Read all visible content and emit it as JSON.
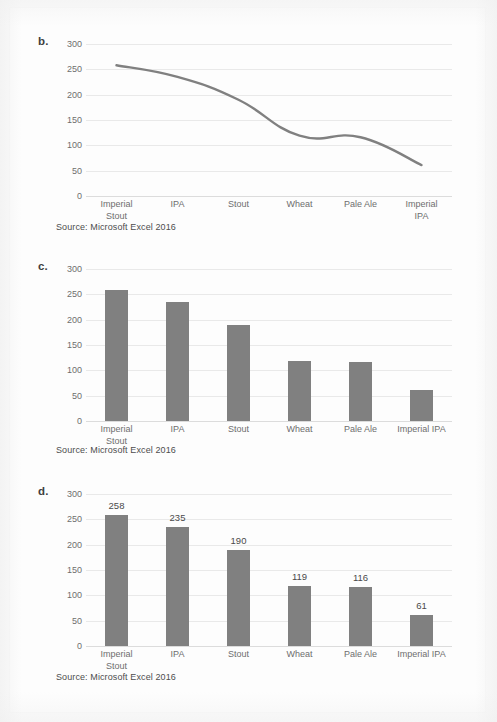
{
  "document": {
    "background_color": "#fdfdfd",
    "series_color": "#808080",
    "gridline_color": "#e9e9e9",
    "text_color": "#6e6e6e"
  },
  "figures": [
    {
      "panel_label": "b.",
      "source_caption": "Source: Microsoft Excel 2016",
      "chart_data": {
        "type": "line",
        "title": "",
        "xlabel": "",
        "ylabel": "",
        "categories": [
          "Imperial Stout",
          "IPA",
          "Stout",
          "Wheat",
          "Pale Ale",
          "Imperial IPA"
        ],
        "category_lines": [
          [
            "Imperial",
            "Stout"
          ],
          [
            "IPA"
          ],
          [
            "Stout"
          ],
          [
            "Wheat"
          ],
          [
            "Pale Ale"
          ],
          [
            "Imperial",
            "IPA"
          ]
        ],
        "values": [
          258,
          235,
          190,
          119,
          116,
          61
        ],
        "ylim": [
          0,
          300
        ],
        "yticks": [
          300,
          250,
          200,
          150,
          100,
          50,
          0
        ],
        "grid": true,
        "legend": "none",
        "smooth": true,
        "show_data_labels": false,
        "show_markers": false
      }
    },
    {
      "panel_label": "c.",
      "source_caption": "Source: Microsoft Excel 2016",
      "chart_data": {
        "type": "bar",
        "title": "",
        "xlabel": "",
        "ylabel": "",
        "categories": [
          "Imperial Stout",
          "IPA",
          "Stout",
          "Wheat",
          "Pale Ale",
          "Imperial IPA"
        ],
        "category_lines": [
          [
            "Imperial",
            "Stout"
          ],
          [
            "IPA"
          ],
          [
            "Stout"
          ],
          [
            "Wheat"
          ],
          [
            "Pale Ale"
          ],
          [
            "Imperial IPA"
          ]
        ],
        "values": [
          258,
          235,
          190,
          119,
          116,
          61
        ],
        "ylim": [
          0,
          300
        ],
        "yticks": [
          300,
          250,
          200,
          150,
          100,
          50,
          0
        ],
        "grid": true,
        "legend": "none",
        "show_data_labels": false
      }
    },
    {
      "panel_label": "d.",
      "source_caption": "Source: Microsoft Excel 2016",
      "chart_data": {
        "type": "bar",
        "title": "",
        "xlabel": "",
        "ylabel": "",
        "categories": [
          "Imperial Stout",
          "IPA",
          "Stout",
          "Wheat",
          "Pale Ale",
          "Imperial IPA"
        ],
        "category_lines": [
          [
            "Imperial",
            "Stout"
          ],
          [
            "IPA"
          ],
          [
            "Stout"
          ],
          [
            "Wheat"
          ],
          [
            "Pale Ale"
          ],
          [
            "Imperial IPA"
          ]
        ],
        "values": [
          258,
          235,
          190,
          119,
          116,
          61
        ],
        "data_labels": [
          "258",
          "235",
          "190",
          "119",
          "116",
          "61"
        ],
        "ylim": [
          0,
          300
        ],
        "yticks": [
          300,
          250,
          200,
          150,
          100,
          50,
          0
        ],
        "grid": true,
        "legend": "none",
        "show_data_labels": true
      }
    }
  ]
}
